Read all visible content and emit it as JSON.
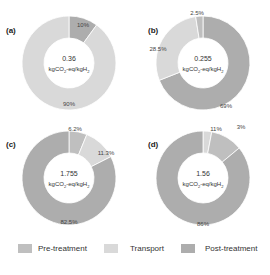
{
  "chart_data": [
    {
      "type": "pie",
      "variant": "donut",
      "panel": "(a)",
      "center_value": "0.36",
      "center_unit": "kgCO2-eq/kgH2",
      "slices": [
        {
          "name": "Post-treatment",
          "value": 10,
          "label": "10%"
        },
        {
          "name": "Transport",
          "value": 90,
          "label": "90%"
        }
      ]
    },
    {
      "type": "pie",
      "variant": "donut",
      "panel": "(b)",
      "center_value": "0.255",
      "center_unit": "kgCO2-eq/kgH2",
      "slices": [
        {
          "name": "Post-treatment",
          "value": 69,
          "label": "69%"
        },
        {
          "name": "Transport",
          "value": 28.5,
          "label": "28.5%"
        },
        {
          "name": "Pre-treatment",
          "value": 2.5,
          "label": "2.5%"
        }
      ]
    },
    {
      "type": "pie",
      "variant": "donut",
      "panel": "(c)",
      "center_value": "1.755",
      "center_unit": "kgCO2-eq/kgH2",
      "slices": [
        {
          "name": "Pre-treatment",
          "value": 6.2,
          "label": "6.2%"
        },
        {
          "name": "Transport",
          "value": 11.3,
          "label": "11.3%"
        },
        {
          "name": "Post-treatment",
          "value": 82.5,
          "label": "82.5%"
        }
      ]
    },
    {
      "type": "pie",
      "variant": "donut",
      "panel": "(d)",
      "center_value": "1.56",
      "center_unit": "kgCO2-eq/kgH2",
      "slices": [
        {
          "name": "Transport",
          "value": 3,
          "label": "3%"
        },
        {
          "name": "Pre-treatment",
          "value": 11,
          "label": "11%"
        },
        {
          "name": "Post-treatment",
          "value": 86,
          "label": "86%"
        }
      ]
    }
  ],
  "legend": [
    {
      "name": "Pre-treatment",
      "color": "#bfbfbf"
    },
    {
      "name": "Transport",
      "color": "#d9d9d9"
    },
    {
      "name": "Post-treatment",
      "color": "#adadad"
    }
  ],
  "colors": {
    "Pre-treatment": "#bfbfbf",
    "Transport": "#d9d9d9",
    "Post-treatment": "#adadad"
  }
}
